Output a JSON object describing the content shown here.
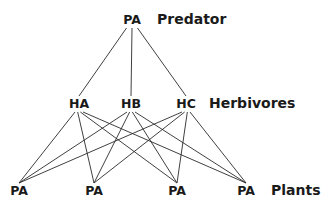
{
  "diagram": {
    "type": "food-web",
    "levels": [
      {
        "id": "predator",
        "label": "Predator",
        "nodes": [
          {
            "id": "P",
            "label": "PA"
          }
        ]
      },
      {
        "id": "herbivores",
        "label": "Herbivores",
        "nodes": [
          {
            "id": "HA",
            "label": "HA"
          },
          {
            "id": "HB",
            "label": "HB"
          },
          {
            "id": "HC",
            "label": "HC"
          }
        ]
      },
      {
        "id": "plants",
        "label": "Plants",
        "nodes": [
          {
            "id": "PL1",
            "label": "PA"
          },
          {
            "id": "PL2",
            "label": "PA"
          },
          {
            "id": "PL3",
            "label": "PA"
          },
          {
            "id": "PL4",
            "label": "PA"
          }
        ]
      }
    ],
    "edges": [
      [
        "P",
        "HA"
      ],
      [
        "P",
        "HB"
      ],
      [
        "P",
        "HC"
      ],
      [
        "HA",
        "PL1"
      ],
      [
        "HA",
        "PL2"
      ],
      [
        "HA",
        "PL3"
      ],
      [
        "HA",
        "PL4"
      ],
      [
        "HB",
        "PL1"
      ],
      [
        "HB",
        "PL2"
      ],
      [
        "HB",
        "PL3"
      ],
      [
        "HB",
        "PL4"
      ],
      [
        "HC",
        "PL1"
      ],
      [
        "HC",
        "PL2"
      ],
      [
        "HC",
        "PL3"
      ],
      [
        "HC",
        "PL4"
      ]
    ]
  }
}
